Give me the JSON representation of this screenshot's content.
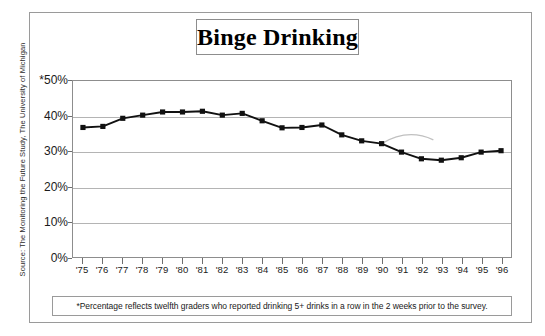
{
  "title": "Binge Drinking",
  "source_credit": "Source: The Monitoring the Future Study, The University of Michigan",
  "footnote": "*Percentage reflects twelfth graders who reported drinking 5+ drinks in a row in the 2 weeks prior to the survey.",
  "colors": {
    "line": "#111111",
    "marker": "#111111",
    "gridline": "#b4b4b4",
    "frame": "#8d8d8d",
    "text": "#1a1a1a",
    "artifact": "#c0c0c0",
    "background": "#ffffff"
  },
  "chart_data": {
    "type": "line",
    "title": "Binge Drinking",
    "xlabel": "",
    "ylabel": "",
    "ylim": [
      0,
      50
    ],
    "yticks": [
      0,
      10,
      20,
      30,
      40,
      50
    ],
    "ytick_labels": [
      "0%",
      "10%",
      "20%",
      "30%",
      "40%",
      "*50%"
    ],
    "grid": true,
    "legend": "none",
    "categories": [
      "'75",
      "'76",
      "'77",
      "'78",
      "'79",
      "'80",
      "'81",
      "'82",
      "'83",
      "'84",
      "'85",
      "'86",
      "'87",
      "'88",
      "'89",
      "'90",
      "'91",
      "'92",
      "'93",
      "'94",
      "'95",
      "'96"
    ],
    "values": [
      36.8,
      37.1,
      39.4,
      40.3,
      41.2,
      41.2,
      41.4,
      40.3,
      40.8,
      38.7,
      36.7,
      36.8,
      37.5,
      34.7,
      33.0,
      32.2,
      29.8,
      27.9,
      27.5,
      28.2,
      29.8,
      30.2
    ],
    "annotations": [
      {
        "name": "scan-arc-artifact",
        "note": "faint gray curved arc near 1991-1992"
      }
    ]
  }
}
